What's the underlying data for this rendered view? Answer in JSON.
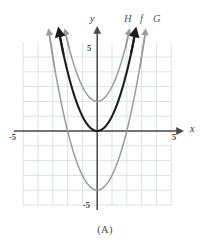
{
  "caption": "(A)",
  "axes": {
    "x_label": "x",
    "y_label": "y",
    "x_tick_left": "-5",
    "x_tick_right": "5",
    "y_tick_top": "5",
    "y_tick_bottom": "-5"
  },
  "curve_labels": {
    "H": "H",
    "f": "f",
    "G": "G"
  },
  "colors": {
    "grid": "#cfd4dc",
    "axis": "#4a4a4a",
    "curve_bold": "#1c1c1c",
    "curve_gray": "#8c8c8c",
    "text": "#4a4a4a"
  },
  "chart_data": {
    "type": "line",
    "title": "",
    "xlabel": "x",
    "ylabel": "y",
    "xlim": [
      -5,
      5
    ],
    "ylim": [
      -5,
      5
    ],
    "grid": true,
    "legend_position": "top-right",
    "x": [
      -2.6,
      -2.4,
      -2.2,
      -2.0,
      -1.8,
      -1.6,
      -1.4,
      -1.2,
      -1.0,
      -0.8,
      -0.6,
      -0.4,
      -0.2,
      0,
      0.2,
      0.4,
      0.6,
      0.8,
      1.0,
      1.2,
      1.4,
      1.6,
      1.8,
      2.0,
      2.2,
      2.4,
      2.6
    ],
    "series": [
      {
        "name": "H",
        "label": "H",
        "color": "#8c8c8c",
        "style": "gray",
        "equation": "y = x^2 + 2",
        "vertex": [
          0,
          2
        ],
        "values": [
          8.76,
          7.76,
          6.84,
          6.0,
          5.24,
          4.56,
          3.96,
          3.44,
          3.0,
          2.64,
          2.36,
          2.16,
          2.04,
          2.0,
          2.04,
          2.16,
          2.36,
          2.64,
          3.0,
          3.44,
          3.96,
          4.56,
          5.24,
          6.0,
          6.84,
          7.76,
          8.76
        ]
      },
      {
        "name": "f",
        "label": "f",
        "color": "#1c1c1c",
        "style": "bold",
        "equation": "y = x^2",
        "vertex": [
          0,
          0
        ],
        "values": [
          6.76,
          5.76,
          4.84,
          4.0,
          3.24,
          2.56,
          1.96,
          1.44,
          1.0,
          0.64,
          0.36,
          0.16,
          0.04,
          0,
          0.04,
          0.16,
          0.36,
          0.64,
          1.0,
          1.44,
          1.96,
          2.56,
          3.24,
          4.0,
          4.84,
          5.76,
          6.76
        ]
      },
      {
        "name": "G",
        "label": "G",
        "color": "#8c8c8c",
        "style": "gray",
        "equation": "y = x^2 - 4",
        "vertex": [
          0,
          -4
        ],
        "values": [
          2.76,
          1.76,
          0.84,
          0.0,
          -0.76,
          -1.44,
          -2.04,
          -2.56,
          -3.0,
          -3.36,
          -3.64,
          -3.84,
          -3.96,
          -4.0,
          -3.96,
          -3.84,
          -3.64,
          -3.36,
          -3.0,
          -2.56,
          -2.04,
          -1.44,
          -0.76,
          0.0,
          0.84,
          1.76,
          2.76
        ]
      }
    ]
  }
}
